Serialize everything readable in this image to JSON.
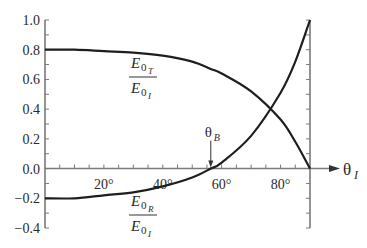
{
  "chart_data": {
    "type": "line",
    "title": "",
    "xlabel": "θI",
    "ylabel": "",
    "xlim": [
      0,
      90
    ],
    "ylim": [
      -0.4,
      1.0
    ],
    "grid": false,
    "x_ticks": [
      {
        "value": 20,
        "label": "20°"
      },
      {
        "value": 40,
        "label": "40°"
      },
      {
        "value": 60,
        "label": "60°"
      },
      {
        "value": 80,
        "label": "80°"
      }
    ],
    "x_minor_step": 5,
    "y_ticks": [
      {
        "value": 1.0,
        "label": "1.0"
      },
      {
        "value": 0.8,
        "label": "0.8"
      },
      {
        "value": 0.6,
        "label": "0.6"
      },
      {
        "value": 0.4,
        "label": "0.4"
      },
      {
        "value": 0.2,
        "label": "0.2"
      },
      {
        "value": 0.0,
        "label": "0.0"
      },
      {
        "value": -0.2,
        "label": "−0.2"
      },
      {
        "value": -0.4,
        "label": "−0.4"
      }
    ],
    "y_minor_step": 0.1,
    "refractive_index_ratio": 1.5,
    "series": [
      {
        "name": "E0T / E0I",
        "label_num": "E",
        "label_num_sub": "0",
        "label_num_subsub": "T",
        "label_den": "E",
        "label_den_sub": "0",
        "label_den_subsub": "I",
        "x": [
          0,
          10,
          20,
          30,
          40,
          50,
          56.3,
          60,
          70,
          80,
          85,
          90
        ],
        "values": [
          0.8,
          0.8,
          0.79,
          0.78,
          0.76,
          0.72,
          0.67,
          0.64,
          0.52,
          0.33,
          0.18,
          0.0
        ]
      },
      {
        "name": "E0R / E0I",
        "label_num": "E",
        "label_num_sub": "0",
        "label_num_subsub": "R",
        "label_den": "E",
        "label_den_sub": "0",
        "label_den_subsub": "I",
        "x": [
          0,
          10,
          20,
          30,
          40,
          50,
          56.3,
          60,
          70,
          80,
          85,
          90
        ],
        "values": [
          -0.2,
          -0.2,
          -0.18,
          -0.16,
          -0.12,
          -0.06,
          0.0,
          0.04,
          0.22,
          0.51,
          0.72,
          1.0
        ]
      }
    ],
    "annotations": [
      {
        "text": "θB",
        "main": "θ",
        "sub": "B",
        "x": 56.3,
        "y": 0.0,
        "arrow": true
      }
    ]
  }
}
